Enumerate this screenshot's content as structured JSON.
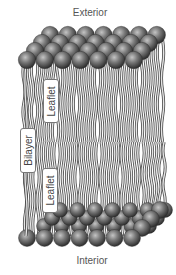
{
  "diagram": {
    "type": "lipid-bilayer-illustration",
    "labels": {
      "exterior": "Exterior",
      "interior": "Interior",
      "bilayer": "Bilayer",
      "leaflet_top": "Leaflet",
      "leaflet_bottom": "Leaflet"
    },
    "components": {
      "head_groups": "gray-sphere",
      "tails": "wavy-double-line"
    },
    "colors": {
      "sphere_dark": "#3a3a3a",
      "sphere_light": "#b8b8b8",
      "tail_stroke": "#555555",
      "tail_fill": "#e8e8e8",
      "label_text": "#555555"
    }
  }
}
